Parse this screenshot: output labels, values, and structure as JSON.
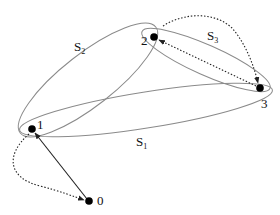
{
  "colors": {
    "ellipse": "#8a8a8a",
    "node": "#000000",
    "edge": "#222222"
  },
  "nodes": [
    {
      "id": "0",
      "label": "0",
      "x": 89,
      "y": 201
    },
    {
      "id": "1",
      "label": "1",
      "x": 32,
      "y": 129
    },
    {
      "id": "2",
      "label": "2",
      "x": 154,
      "y": 37
    },
    {
      "id": "3",
      "label": "3",
      "x": 260,
      "y": 88
    }
  ],
  "sets": [
    {
      "name": "S",
      "sub": "1",
      "label_x": 136,
      "label_y": 146
    },
    {
      "name": "S",
      "sub": "2",
      "label_x": 74,
      "label_y": 51
    },
    {
      "name": "S",
      "sub": "3",
      "label_x": 207,
      "label_y": 40
    }
  ],
  "edges": [
    {
      "from": "0",
      "to": "1",
      "style": "solid",
      "shape": "straight"
    },
    {
      "from": "1",
      "to": "0",
      "style": "dotted",
      "shape": "curved"
    },
    {
      "from": "3",
      "to": "2",
      "style": "dotted",
      "shape": "straight"
    },
    {
      "from": "2",
      "to": "3",
      "style": "dotted",
      "shape": "curved"
    }
  ]
}
